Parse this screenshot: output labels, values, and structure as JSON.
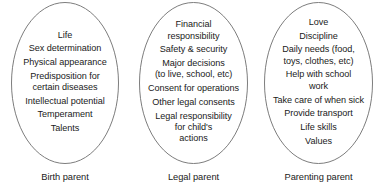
{
  "diagram": {
    "type": "venn-style-grouping",
    "title": "",
    "stroke_color": "#7d7d7d",
    "text_color": "#1a1a1a",
    "background_color": "#ffffff",
    "groups": [
      {
        "id": "birth-parent",
        "caption": "Birth parent",
        "items": [
          "Life",
          "Sex determination",
          "Physical appearance",
          "Predisposition for\ncertain diseases",
          "Intellectual potential",
          "Temperament",
          "Talents"
        ]
      },
      {
        "id": "legal-parent",
        "caption": "Legal parent",
        "items": [
          "Financial\nresponsibility",
          "Safety & security",
          "Major decisions\n(to live, school, etc)",
          "Consent for operations",
          "Other legal consents",
          "Legal responsibility\nfor child's\nactions"
        ]
      },
      {
        "id": "parenting-parent",
        "caption": "Parenting parent",
        "items": [
          "Love",
          "Discipline",
          "Daily needs (food,\ntoys, clothes, etc)",
          "Help with school\nwork",
          "Take care of when sick",
          "Provide transport",
          "Life skills",
          "Values"
        ]
      }
    ]
  }
}
